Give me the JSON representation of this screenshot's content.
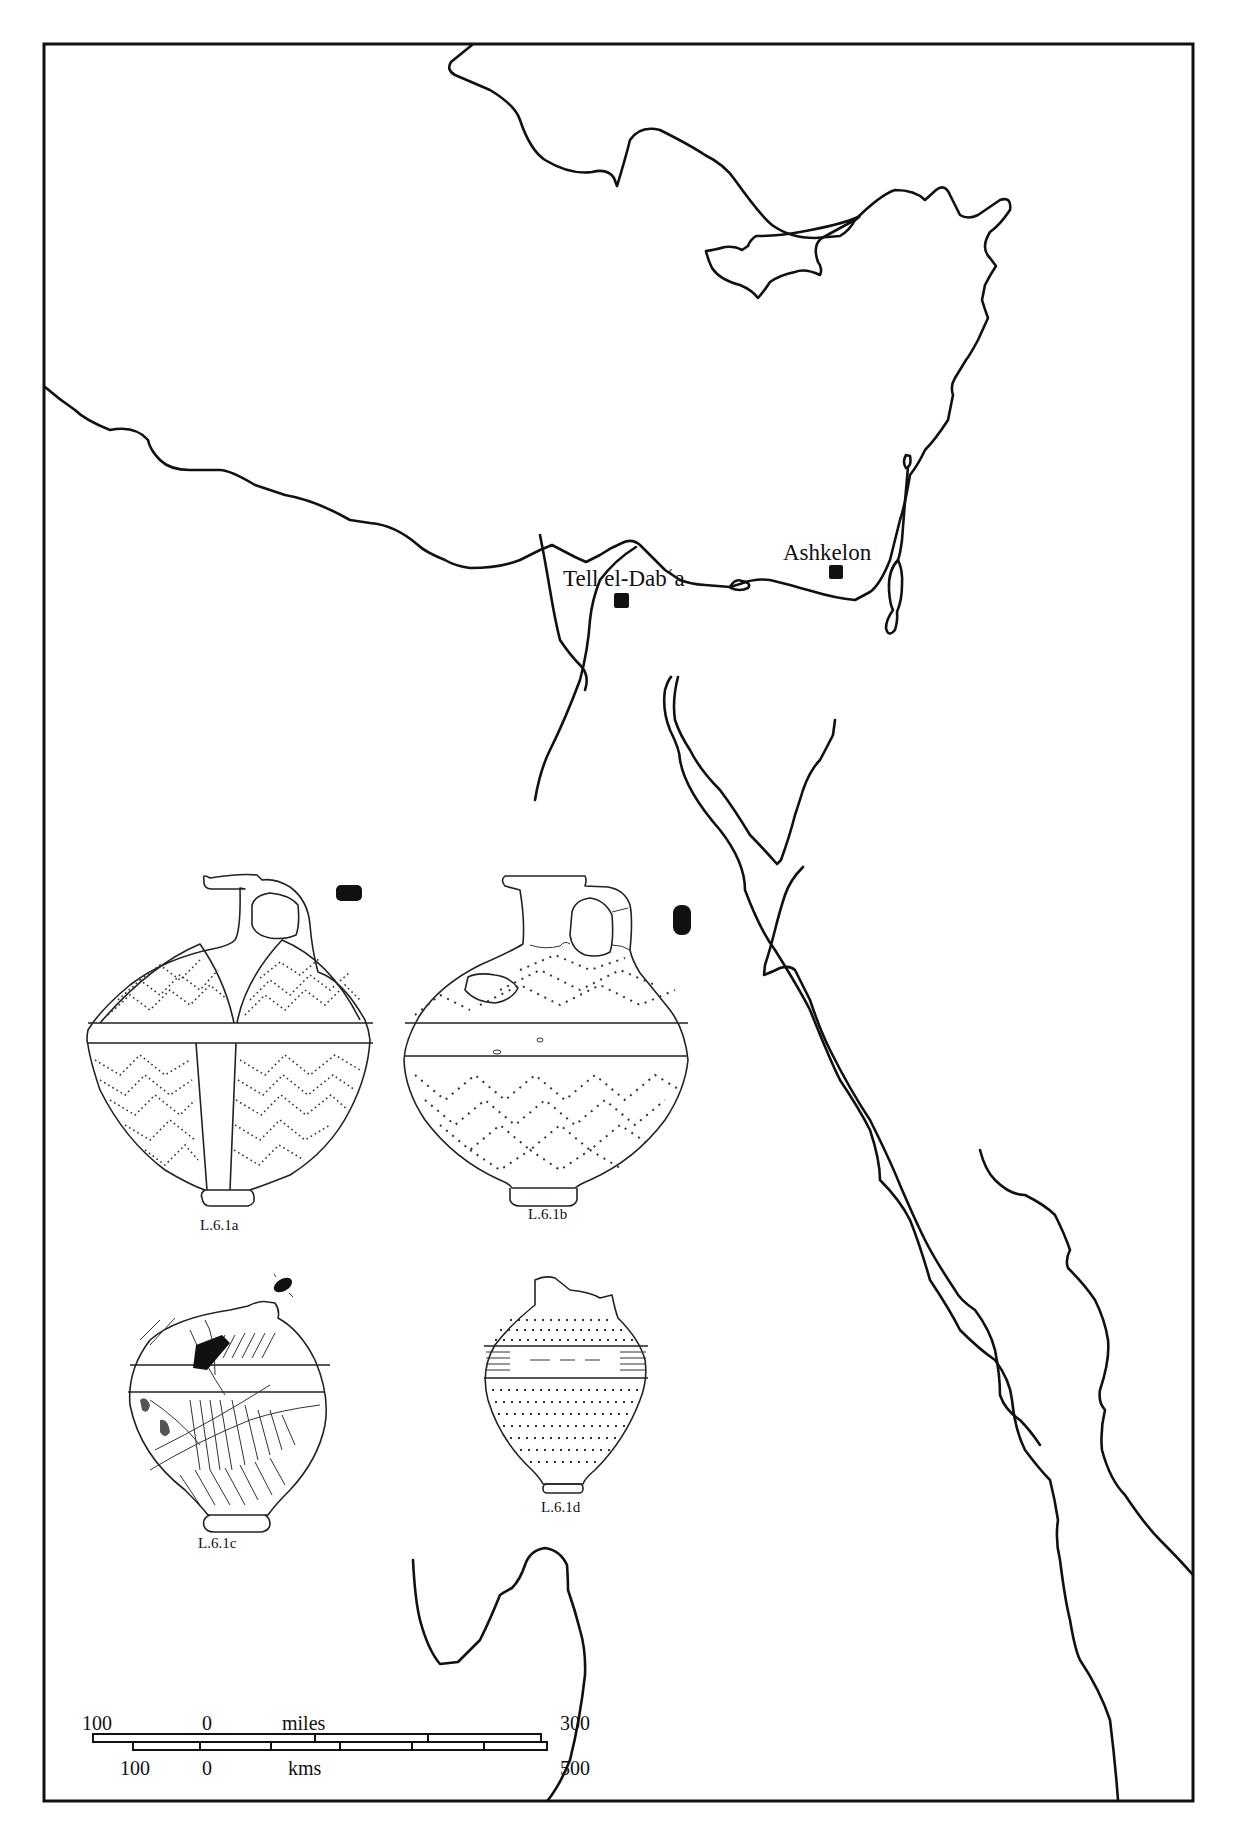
{
  "figure": {
    "type": "distribution map with ceramic illustrations",
    "frame": {
      "stroke_color": "#111111",
      "background": "#ffffff"
    }
  },
  "map": {
    "sites": [
      {
        "name": "Tell el-Dabʿa",
        "marker": "filled-square",
        "color": "#111111"
      },
      {
        "name": "Ashkelon",
        "marker": "filled-square",
        "color": "#111111"
      }
    ]
  },
  "vessels": [
    {
      "id": "L.6.1a",
      "caption": "L.6.1a",
      "section_marker": "filled-bar"
    },
    {
      "id": "L.6.1b",
      "caption": "L.6.1b",
      "section_marker": "filled-oval"
    },
    {
      "id": "L.6.1c",
      "caption": "L.6.1c",
      "section_marker": "filled-ellipse"
    },
    {
      "id": "L.6.1d",
      "caption": "L.6.1d",
      "section_marker": "none"
    }
  ],
  "scale_bar": {
    "miles": {
      "unit_label": "miles",
      "left": "100",
      "zero": "0",
      "right": "300"
    },
    "kms": {
      "unit_label": "kms",
      "left": "100",
      "zero": "0",
      "right": "500"
    }
  }
}
